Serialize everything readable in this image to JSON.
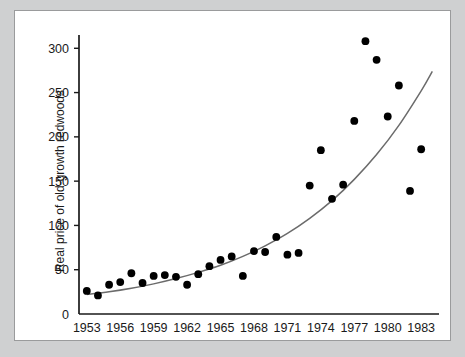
{
  "figure": {
    "background_color": "#cfd0d1",
    "panel_color": "#ffffff",
    "border_color": "#9a9b9c"
  },
  "chart_data": {
    "type": "scatter",
    "title": "",
    "xlabel": "",
    "ylabel": "Real price of old-growth redwoods",
    "xlim": [
      1952.3,
      1984.6
    ],
    "ylim": [
      0,
      315
    ],
    "xticks": [
      1953,
      1956,
      1959,
      1962,
      1965,
      1968,
      1971,
      1974,
      1977,
      1980,
      1983
    ],
    "yticks": [
      0,
      50,
      100,
      150,
      200,
      250,
      300
    ],
    "xtick_labels": [
      "1953",
      "1956",
      "1959",
      "1962",
      "1965",
      "1968",
      "1971",
      "1974",
      "1977",
      "1980",
      "1983"
    ],
    "ytick_labels": [
      "0",
      "50",
      "100",
      "150",
      "200",
      "250",
      "300"
    ],
    "grid": false,
    "legend": "none",
    "point_color": "#000000",
    "curve_color": "#6b6b6b",
    "x": [
      1953,
      1954,
      1955,
      1956,
      1957,
      1958,
      1959,
      1960,
      1961,
      1962,
      1963,
      1964,
      1965,
      1966,
      1967,
      1968,
      1969,
      1970,
      1971,
      1972,
      1973,
      1974,
      1975,
      1976,
      1977,
      1978,
      1979,
      1980,
      1981,
      1982,
      1983,
      1984
    ],
    "y": [
      26,
      21,
      33,
      36,
      46,
      35,
      43,
      44,
      42,
      33,
      45,
      54,
      61,
      65,
      43,
      71,
      70,
      87,
      67,
      69,
      145,
      185,
      130,
      146,
      218,
      308,
      287,
      223,
      258,
      139,
      186
    ],
    "series": [
      {
        "name": "Observed real price",
        "marker": "filled-circle",
        "points": [
          {
            "x": 1953,
            "y": 26
          },
          {
            "x": 1954,
            "y": 21
          },
          {
            "x": 1955,
            "y": 33
          },
          {
            "x": 1956,
            "y": 36
          },
          {
            "x": 1957,
            "y": 46
          },
          {
            "x": 1958,
            "y": 35
          },
          {
            "x": 1959,
            "y": 43
          },
          {
            "x": 1960,
            "y": 44
          },
          {
            "x": 1961,
            "y": 42
          },
          {
            "x": 1962,
            "y": 33
          },
          {
            "x": 1963,
            "y": 45
          },
          {
            "x": 1964,
            "y": 54
          },
          {
            "x": 1965,
            "y": 61
          },
          {
            "x": 1966,
            "y": 65
          },
          {
            "x": 1967,
            "y": 43
          },
          {
            "x": 1968,
            "y": 71
          },
          {
            "x": 1969,
            "y": 70
          },
          {
            "x": 1970,
            "y": 87
          },
          {
            "x": 1971,
            "y": 67
          },
          {
            "x": 1972,
            "y": 69
          },
          {
            "x": 1973,
            "y": 145
          },
          {
            "x": 1974,
            "y": 185
          },
          {
            "x": 1975,
            "y": 130
          },
          {
            "x": 1976,
            "y": 146
          },
          {
            "x": 1977,
            "y": 218
          },
          {
            "x": 1978,
            "y": 308
          },
          {
            "x": 1979,
            "y": 287
          },
          {
            "x": 1980,
            "y": 223
          },
          {
            "x": 1981,
            "y": 258
          },
          {
            "x": 1982,
            "y": 139
          },
          {
            "x": 1983,
            "y": 186
          }
        ]
      },
      {
        "name": "Exponential trend fit",
        "marker": "line",
        "points": [
          {
            "x": 1953,
            "y": 22
          },
          {
            "x": 1955,
            "y": 25
          },
          {
            "x": 1957,
            "y": 29
          },
          {
            "x": 1959,
            "y": 34
          },
          {
            "x": 1961,
            "y": 40
          },
          {
            "x": 1963,
            "y": 47
          },
          {
            "x": 1965,
            "y": 55
          },
          {
            "x": 1967,
            "y": 65
          },
          {
            "x": 1969,
            "y": 77
          },
          {
            "x": 1971,
            "y": 91
          },
          {
            "x": 1973,
            "y": 108
          },
          {
            "x": 1975,
            "y": 128
          },
          {
            "x": 1977,
            "y": 152
          },
          {
            "x": 1979,
            "y": 180
          },
          {
            "x": 1981,
            "y": 213
          },
          {
            "x": 1983,
            "y": 252
          },
          {
            "x": 1984,
            "y": 274
          }
        ]
      }
    ]
  }
}
